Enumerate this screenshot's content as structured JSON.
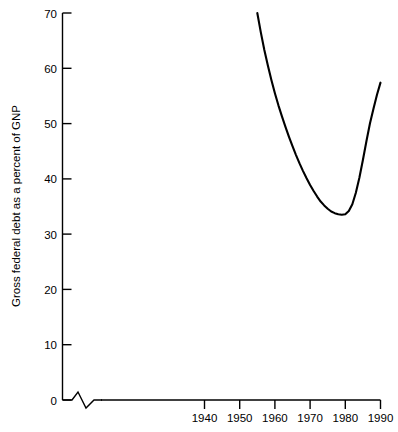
{
  "chart_data": {
    "type": "line",
    "title": "",
    "subtitle": "",
    "xlabel": "",
    "ylabel": "Gross federal debt as a percent of GNP",
    "xlim": [
      1931,
      1990
    ],
    "ylim": [
      0,
      70
    ],
    "grid": false,
    "legend": null,
    "xticks": [
      "1940",
      "1950",
      "1960",
      "1970",
      "1980",
      "1990"
    ],
    "xtick_values": [
      1940,
      1950,
      1960,
      1970,
      1980,
      1990
    ],
    "yticks": [
      "0",
      "10",
      "20",
      "30",
      "40",
      "50",
      "60",
      "70"
    ],
    "ytick_values": [
      0,
      10,
      20,
      30,
      40,
      50,
      60,
      70
    ],
    "annotations": [
      "axis-break-zigzag"
    ],
    "series": [
      {
        "name": "Gross federal debt as a percent of GNP",
        "color": "#000000",
        "x": [
          1955,
          1956,
          1957,
          1958,
          1959,
          1960,
          1961,
          1962,
          1963,
          1964,
          1965,
          1966,
          1967,
          1968,
          1969,
          1970,
          1971,
          1972,
          1973,
          1974,
          1975,
          1976,
          1977,
          1978,
          1979,
          1980,
          1981,
          1982,
          1983,
          1984,
          1985,
          1986,
          1987,
          1988,
          1989,
          1990
        ],
        "values": [
          70.0,
          66.5,
          63.3,
          60.5,
          57.9,
          55.5,
          53.3,
          51.3,
          49.4,
          47.6,
          45.9,
          44.3,
          42.8,
          41.4,
          40.1,
          38.9,
          37.8,
          36.8,
          35.9,
          35.2,
          34.6,
          34.1,
          33.8,
          33.6,
          33.5,
          33.6,
          34.2,
          35.4,
          37.5,
          40.2,
          43.4,
          46.8,
          50.0,
          52.7,
          55.2,
          57.4
        ]
      }
    ]
  },
  "axis": {
    "y_title": "Gross federal debt as a percent of GNP"
  }
}
